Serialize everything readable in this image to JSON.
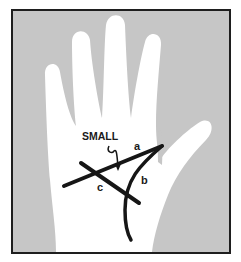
{
  "figure": {
    "colors": {
      "background": "#c6c6c6",
      "hand": "#ffffff",
      "lines": "#161616",
      "frame": "#1e1e1e"
    },
    "labels": {
      "small": "SMALL",
      "a": "a",
      "b": "b",
      "c": "c"
    }
  }
}
